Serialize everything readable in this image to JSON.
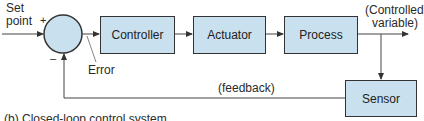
{
  "diagram": {
    "type": "closed-loop control block diagram",
    "input_label_line1": "Set",
    "input_label_line2": "point",
    "plus_sign": "+",
    "minus_sign": "–",
    "error_label": "Error",
    "blocks": [
      {
        "id": "controller",
        "label": "Controller"
      },
      {
        "id": "actuator",
        "label": "Actuator"
      },
      {
        "id": "process",
        "label": "Process"
      },
      {
        "id": "sensor",
        "label": "Sensor"
      }
    ],
    "output_label_line1": "(Controlled",
    "output_label_line2": "variable)",
    "feedback_label": "(feedback)",
    "caption": "(b)  Closed-loop control system",
    "colors": {
      "block_fill": "#c9e0ef",
      "stroke": "#333333"
    }
  }
}
